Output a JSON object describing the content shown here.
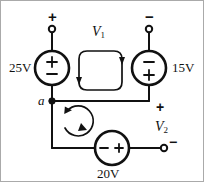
{
  "figure": {
    "stroke_color": "#111111",
    "background_color": "#ffffff"
  },
  "sources": {
    "left": {
      "label": "25V",
      "symbol_top": "+",
      "symbol_bottom": "−",
      "name": "voltage-source-25v"
    },
    "right": {
      "label": "15V",
      "symbol_top": "−",
      "symbol_bottom": "+",
      "name": "voltage-source-15v"
    },
    "bottom": {
      "label": "20V",
      "symbol_left": "−",
      "symbol_right": "+",
      "name": "voltage-source-20v"
    }
  },
  "terminals": {
    "top_left": {
      "sign": "+",
      "name": "terminal-top-left"
    },
    "top_right": {
      "sign": "−",
      "name": "terminal-top-right"
    },
    "right_mid": {
      "sign": "+",
      "name": "terminal-v2-plus"
    },
    "right_bottom": {
      "sign": "−",
      "name": "terminal-v2-minus"
    }
  },
  "voltages": {
    "v1": {
      "label": "V",
      "subscript": "1"
    },
    "v2": {
      "label": "V",
      "subscript": "2"
    }
  },
  "nodes": {
    "a": {
      "label": "a"
    }
  },
  "meshes": {
    "top": {
      "direction": "clockwise",
      "name": "mesh-loop-top"
    },
    "bottom": {
      "direction": "clockwise",
      "name": "mesh-loop-bottom"
    }
  }
}
